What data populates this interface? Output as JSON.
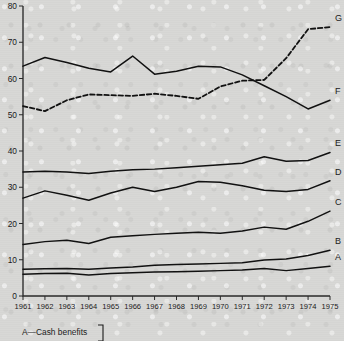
{
  "chart_data": {
    "type": "line",
    "title": "",
    "xlabel": "",
    "ylabel": "",
    "xlim": [
      1961,
      1975
    ],
    "ylim": [
      0,
      80
    ],
    "grid": false,
    "legend_position": "right-edge-inline",
    "categories": [
      1961,
      1962,
      1963,
      1964,
      1965,
      1966,
      1967,
      1968,
      1969,
      1970,
      1971,
      1972,
      1973,
      1974,
      1975
    ],
    "x_tick_labels": [
      "1961",
      "1962",
      "1963",
      "1964",
      "1965",
      "1966",
      "1967",
      "1968",
      "1969",
      "1970",
      "1971",
      "1972",
      "1973",
      "1974",
      "1975"
    ],
    "y_tick_labels": [
      "0",
      "10",
      "20",
      "30",
      "40",
      "50",
      "60",
      "70",
      "80"
    ],
    "y_ticks": [
      0,
      10,
      20,
      30,
      40,
      50,
      60,
      70,
      80
    ],
    "series": [
      {
        "name": "A",
        "label": "A",
        "style": "solid",
        "values": [
          6.0,
          6.2,
          6.3,
          5.8,
          6.2,
          6.4,
          6.6,
          6.7,
          6.8,
          7.0,
          7.2,
          7.6,
          7.0,
          7.6,
          8.2
        ]
      },
      {
        "name": "B",
        "label": "B",
        "style": "solid",
        "values": [
          7.4,
          7.5,
          7.6,
          7.4,
          7.7,
          8.0,
          8.5,
          8.7,
          8.8,
          9.0,
          9.2,
          9.9,
          10.2,
          11.2,
          12.6
        ]
      },
      {
        "name": "C",
        "label": "C",
        "style": "solid",
        "values": [
          14.2,
          15.0,
          15.4,
          14.5,
          16.2,
          16.6,
          17.0,
          17.3,
          17.6,
          17.3,
          17.9,
          19.0,
          18.4,
          20.6,
          23.4
        ]
      },
      {
        "name": "D",
        "label": "D",
        "style": "solid",
        "values": [
          27.0,
          29.0,
          27.8,
          26.4,
          28.4,
          30.0,
          28.8,
          30.0,
          31.6,
          31.4,
          30.4,
          29.2,
          28.8,
          29.4,
          31.8
        ]
      },
      {
        "name": "E",
        "label": "E",
        "style": "solid",
        "values": [
          34.2,
          34.4,
          34.2,
          33.8,
          34.4,
          34.8,
          35.0,
          35.4,
          35.8,
          36.2,
          36.6,
          38.4,
          37.2,
          37.4,
          39.6
        ]
      },
      {
        "name": "F",
        "label": "F",
        "style": "solid",
        "values": [
          63.4,
          65.8,
          64.4,
          62.8,
          61.8,
          66.2,
          61.2,
          62.0,
          63.4,
          63.2,
          61.0,
          58.0,
          55.0,
          51.6,
          54.0
        ]
      },
      {
        "name": "G",
        "label": "G",
        "style": "dashed",
        "values": [
          52.4,
          51.0,
          54.0,
          55.6,
          55.4,
          55.2,
          55.8,
          55.2,
          54.4,
          57.8,
          59.4,
          59.6,
          65.6,
          73.6,
          74.2
        ]
      }
    ]
  },
  "caption": {
    "entries": [
      {
        "key": "A",
        "text": "A—Cash benefits"
      }
    ]
  }
}
